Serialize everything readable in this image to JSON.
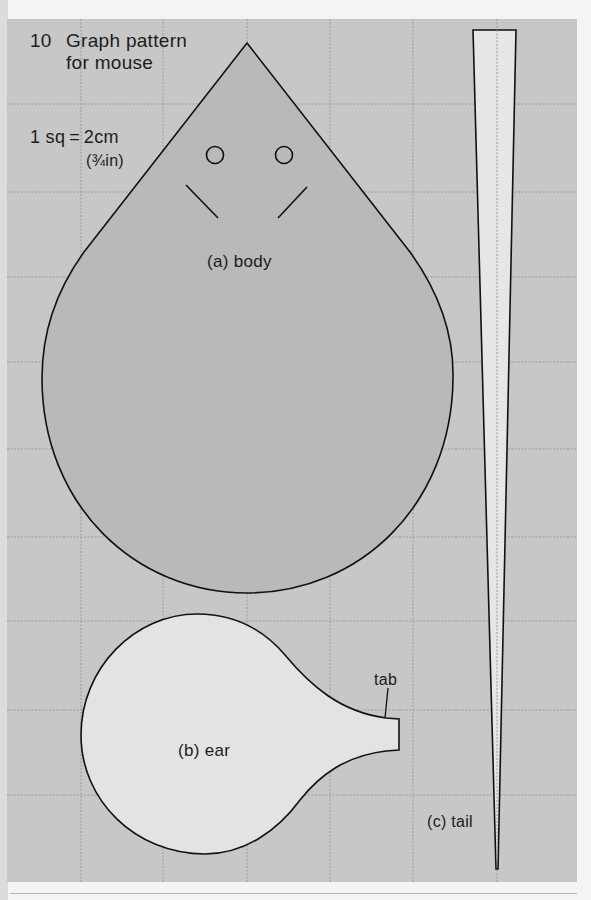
{
  "figure": {
    "number": "10",
    "title_line1": "Graph pattern",
    "title_line2": "for mouse",
    "scale_line1": "1 sq = 2cm",
    "scale_line2": "(¾in)"
  },
  "pieces": {
    "body": {
      "label": "(a) body"
    },
    "ear": {
      "label": "(b) ear",
      "tab_label": "tab"
    },
    "tail": {
      "label": "(c) tail"
    }
  },
  "colors": {
    "background_grid": "#c7c7c7",
    "grid_line": "#9a9a9a",
    "body_fill": "#b9b9b9",
    "ear_fill": "#e3e3e3",
    "tail_fill": "#e6e6e6",
    "outline": "#111111"
  }
}
